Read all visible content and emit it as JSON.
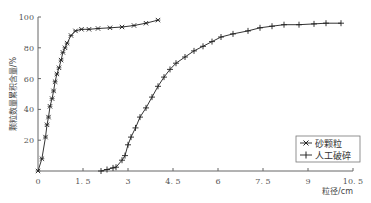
{
  "chart_data": {
    "type": "line",
    "title": "",
    "xlabel": "粒径/cm",
    "ylabel": "颗粒数量累积含量/%",
    "xlim": [
      0,
      10.5
    ],
    "ylim": [
      0,
      100
    ],
    "x_ticks": [
      "0",
      "1.5",
      "3",
      "4.5",
      "6",
      "7.5",
      "9",
      "10.5"
    ],
    "x_tick_values": [
      0,
      1.5,
      3,
      4.5,
      6,
      7.5,
      9,
      10.5
    ],
    "y_ticks": [
      "20",
      "40",
      "60",
      "80",
      "100"
    ],
    "y_tick_values": [
      20,
      40,
      60,
      80,
      100
    ],
    "grid": false,
    "legend_position": "lower right",
    "series": [
      {
        "name": "砂颗粒",
        "marker": "x-star",
        "x": [
          0,
          0.13,
          0.25,
          0.3,
          0.35,
          0.4,
          0.47,
          0.52,
          0.57,
          0.63,
          0.7,
          0.77,
          0.83,
          0.9,
          0.97,
          1.1,
          1.25,
          1.45,
          1.7,
          2.0,
          2.4,
          2.8,
          3.2,
          3.6,
          4.0
        ],
        "y": [
          0,
          8,
          22,
          30,
          35,
          42,
          47,
          52,
          58,
          63,
          67,
          72,
          77,
          80,
          83,
          88,
          91,
          92,
          92,
          92.5,
          93,
          93.5,
          94.5,
          96,
          98
        ]
      },
      {
        "name": "人工破碎",
        "marker": "plus",
        "x": [
          2.1,
          2.3,
          2.5,
          2.6,
          2.8,
          2.9,
          3.0,
          3.1,
          3.25,
          3.4,
          3.6,
          3.8,
          4.0,
          4.2,
          4.4,
          4.6,
          4.9,
          5.2,
          5.5,
          5.8,
          6.1,
          6.5,
          7.0,
          7.4,
          7.8,
          8.2,
          8.7,
          9.2,
          9.6,
          10.1
        ],
        "y": [
          0,
          1,
          2,
          2.5,
          7,
          10,
          17,
          22,
          28,
          35,
          41,
          48,
          55,
          61,
          66,
          70,
          74,
          78,
          81,
          84,
          87,
          89,
          91,
          93,
          94,
          95,
          95,
          95.5,
          96,
          96
        ]
      }
    ]
  }
}
